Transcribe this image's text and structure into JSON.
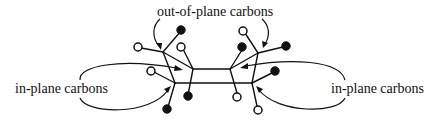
{
  "labels": {
    "top": "out-of-plane carbons",
    "left": "in-plane carbons",
    "right": "in-plane carbons"
  },
  "colors": {
    "ink": "#111111",
    "background": "#ffffff"
  },
  "legend_semantics": {
    "filled_circle": "atom (dark)",
    "open_circle": "atom (light)"
  }
}
